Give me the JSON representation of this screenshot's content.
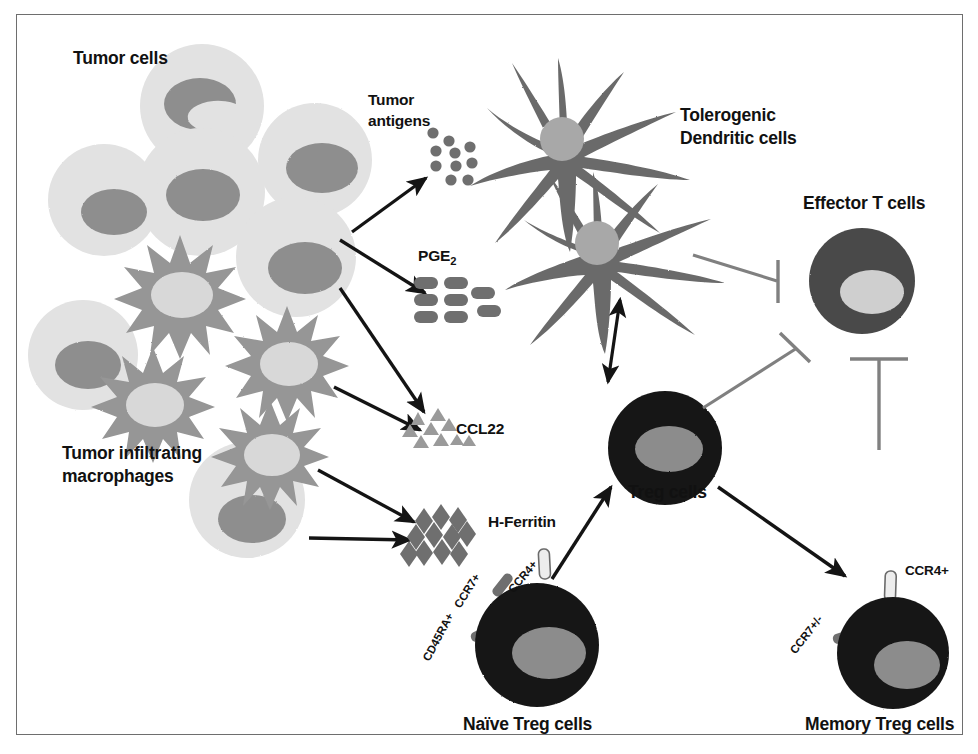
{
  "figure": {
    "title_alt": "Tumor microenvironment and regulatory T cell recruitment diagram",
    "background": "#ffffff",
    "frame_color": "#6e6e6e"
  },
  "palette": {
    "tumor_cell_body": "#e2e2e2",
    "tumor_cell_nucleus": "#8e8e8e",
    "macrophage_body": "#969696",
    "macrophage_nucleus": "#d8d8d8",
    "dendritic_body": "#6b6b6b",
    "dendritic_nucleus": "#a8a8a8",
    "treg_body": "#161616",
    "treg_nucleus": "#8c8c8c",
    "effector_body": "#4a4a4a",
    "effector_nucleus": "#cfcfcf",
    "arrow_color": "#141414",
    "inhibit_color": "#808080",
    "molecule_color": "#6f6f6f",
    "text_color": "#111111"
  },
  "labels": {
    "tumor_cells": "Tumor cells",
    "tumor_antigens_line1": "Tumor",
    "tumor_antigens_line2": "antigens",
    "pge2_main": "PGE",
    "pge2_sub": "2",
    "ccl22": "CCL22",
    "h_ferritin": "H-Ferritin",
    "tumor_infiltrating_line1": "Tumor infiltrating",
    "tumor_infiltrating_line2": "macrophages",
    "tolerogenic_line1": "Tolerogenic",
    "tolerogenic_line2": "Dendritic cells",
    "effector_t_cells": "Effector T cells",
    "treg_cells": "Treg cells",
    "naive_treg_cells": "Naïve Treg cells",
    "memory_treg_cells": "Memory Treg cells"
  },
  "receptors": {
    "naive_cd45ra": "CD45RA+",
    "naive_ccr7": "CCR7+",
    "naive_ccr4": "CCR4+",
    "memory_ccr7": "CCR7+/-",
    "memory_ccr4": "CCR4+"
  },
  "cell_groups": {
    "tumor_cells": {
      "name": "Tumor cells",
      "count": 6,
      "shape": "circle",
      "body_color": "#e2e2e2",
      "nucleus_color": "#8e8e8e"
    },
    "macrophages": {
      "name": "Tumor infiltrating macrophages",
      "count": 4,
      "shape": "star",
      "body_color": "#969696",
      "nucleus_color": "#d8d8d8"
    },
    "dendritic_cells": {
      "name": "Tolerogenic Dendritic cells",
      "count": 2,
      "shape": "dendritic-star",
      "body_color": "#6b6b6b",
      "nucleus_color": "#a8a8a8"
    },
    "treg": {
      "name": "Treg cells",
      "count": 1,
      "shape": "circle",
      "body_color": "#161616",
      "nucleus_color": "#8c8c8c"
    },
    "naive_treg": {
      "name": "Naïve Treg cells",
      "count": 1,
      "shape": "circle",
      "body_color": "#161616",
      "nucleus_color": "#8c8c8c",
      "receptors": [
        "CD45RA+",
        "CCR7+",
        "CCR4+"
      ]
    },
    "memory_treg": {
      "name": "Memory Treg cells",
      "count": 1,
      "shape": "circle",
      "body_color": "#161616",
      "nucleus_color": "#8c8c8c",
      "receptors": [
        "CCR7+/-",
        "CCR4+"
      ]
    },
    "effector_t": {
      "name": "Effector T cells",
      "count": 1,
      "shape": "circle",
      "body_color": "#4a4a4a",
      "nucleus_color": "#cfcfcf"
    }
  },
  "molecules": {
    "tumor_antigens": {
      "label": "Tumor antigens",
      "glyph": "circle",
      "count": 9,
      "color": "#6f6f6f"
    },
    "pge2": {
      "label": "PGE2",
      "glyph": "pill",
      "count": 10,
      "color": "#6f6f6f"
    },
    "ccl22": {
      "label": "CCL22",
      "glyph": "triangle",
      "count": 9,
      "color": "#9a9a9a"
    },
    "h_ferritin": {
      "label": "H-Ferritin",
      "glyph": "diamond",
      "count": 11,
      "color": "#6f6f6f"
    }
  },
  "connections": [
    {
      "from": "tumor-cells",
      "to": "tumor-antigens",
      "type": "arrow"
    },
    {
      "from": "tumor-cells",
      "to": "pge2",
      "type": "arrow"
    },
    {
      "from": "tumor-cells",
      "to": "ccl22",
      "type": "arrow"
    },
    {
      "from": "macrophages",
      "to": "ccl22",
      "type": "arrow"
    },
    {
      "from": "macrophages",
      "to": "h-ferritin",
      "type": "arrow"
    },
    {
      "from": "macrophages",
      "to": "h-ferritin-2",
      "type": "arrow"
    },
    {
      "from": "dendritic-cells",
      "to": "treg-cells",
      "type": "double-arrow"
    },
    {
      "from": "naive-treg-cells",
      "to": "treg-cells",
      "type": "arrow"
    },
    {
      "from": "treg-cells",
      "to": "memory-treg-cells",
      "type": "arrow"
    },
    {
      "from": "dendritic-cells",
      "to": "effector-t-cells",
      "type": "inhibition"
    },
    {
      "from": "treg-cells",
      "to": "effector-t-cells",
      "type": "inhibition"
    },
    {
      "from": "memory-treg-cells",
      "to": "effector-t-cells",
      "type": "inhibition"
    }
  ]
}
